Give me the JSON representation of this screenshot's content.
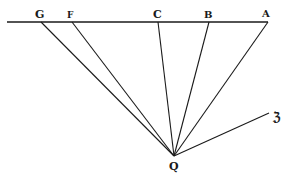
{
  "diagram": {
    "baseline": {
      "x1": 7,
      "y1": 22,
      "x2": 268,
      "y2": 22
    },
    "apex": {
      "label": "Q",
      "x": 174,
      "y": 156
    },
    "points": [
      {
        "label": "G",
        "x": 41,
        "y": 22
      },
      {
        "label": "F",
        "x": 72,
        "y": 22
      },
      {
        "label": "C",
        "x": 158,
        "y": 22
      },
      {
        "label": "B",
        "x": 209,
        "y": 22
      },
      {
        "label": "A",
        "x": 268,
        "y": 22
      }
    ],
    "extra_ray": {
      "label": "ℨ",
      "x": 269,
      "y": 113
    },
    "stroke_color": "#1a1a1a",
    "background": "#ffffff"
  }
}
